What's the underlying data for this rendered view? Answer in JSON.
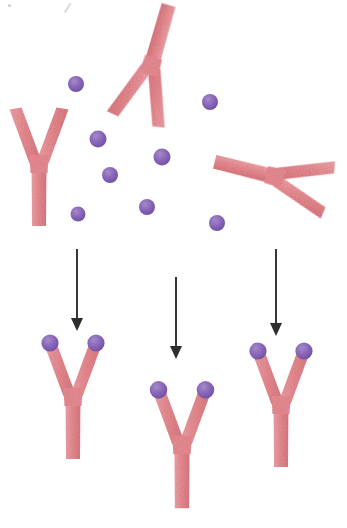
{
  "figure": {
    "background_color": "#ffffff",
    "width": 347,
    "height": 528,
    "style": "hand-drawn scanned illustration with paper grain"
  },
  "palette": {
    "antibody_pink": "#e98c92",
    "antibody_pink_dark": "#dd7880",
    "antibody_pink_light": "#f0a3a8",
    "antigen_purple": "#8a66bd",
    "antigen_purple_light": "#a98fd0",
    "antigen_purple_dark": "#6f4fa3",
    "arrow_color": "#2e2e30",
    "artifact_gray": "#c0c3c8"
  },
  "legend": {
    "antibody_name": "antibody",
    "antigen_name": "antigen",
    "arrow_name": "binding-reaction-arrow"
  },
  "top_panel": {
    "label": "free antibodies and free antigens",
    "free_antibodies": [
      {
        "id": "free-antibody-left",
        "cx": 39,
        "cy": 167,
        "rotation": 0,
        "scale": 1.0
      },
      {
        "id": "free-antibody-middle",
        "cx": 152,
        "cy": 63,
        "rotation": 196,
        "scale": 1.02
      },
      {
        "id": "free-antibody-right",
        "cx": 272,
        "cy": 176,
        "rotation": 104,
        "scale": 1.0
      }
    ],
    "free_antigens": [
      {
        "id": "free-antigen-1",
        "cx": 76,
        "cy": 84,
        "r": 8.0
      },
      {
        "id": "free-antigen-2",
        "cx": 210,
        "cy": 102,
        "r": 8.0
      },
      {
        "id": "free-antigen-3",
        "cx": 98,
        "cy": 139,
        "r": 8.5
      },
      {
        "id": "free-antigen-4",
        "cx": 162,
        "cy": 157,
        "r": 8.5
      },
      {
        "id": "free-antigen-5",
        "cx": 110,
        "cy": 175,
        "r": 8.0
      },
      {
        "id": "free-antigen-6",
        "cx": 147,
        "cy": 207,
        "r": 8.0
      },
      {
        "id": "free-antigen-7",
        "cx": 78,
        "cy": 214,
        "r": 7.5
      },
      {
        "id": "free-antigen-8",
        "cx": 217,
        "cy": 223,
        "r": 8.0
      }
    ],
    "free_antibody_count": 3,
    "free_antigen_count": 8
  },
  "arrows": [
    {
      "id": "arrow-left",
      "x": 77,
      "y_start": 249,
      "y_end": 331
    },
    {
      "id": "arrow-middle",
      "x": 176,
      "y_start": 277,
      "y_end": 359
    },
    {
      "id": "arrow-right",
      "x": 276,
      "y_start": 249,
      "y_end": 336
    }
  ],
  "bottom_panel": {
    "label": "antibody-antigen complexes",
    "complexes": [
      {
        "id": "complex-left",
        "cx": 73,
        "cy": 400,
        "scale": 1.0,
        "bound_antigens": 2
      },
      {
        "id": "complex-middle",
        "cx": 182,
        "cy": 448,
        "scale": 1.02,
        "bound_antigens": 2
      },
      {
        "id": "complex-right",
        "cx": 281,
        "cy": 408,
        "scale": 1.0,
        "bound_antigens": 2
      }
    ],
    "complex_count": 3
  },
  "artifacts": [
    {
      "id": "artifact-dot",
      "kind": "speckle"
    },
    {
      "id": "artifact-slash",
      "kind": "pen-stroke"
    }
  ]
}
